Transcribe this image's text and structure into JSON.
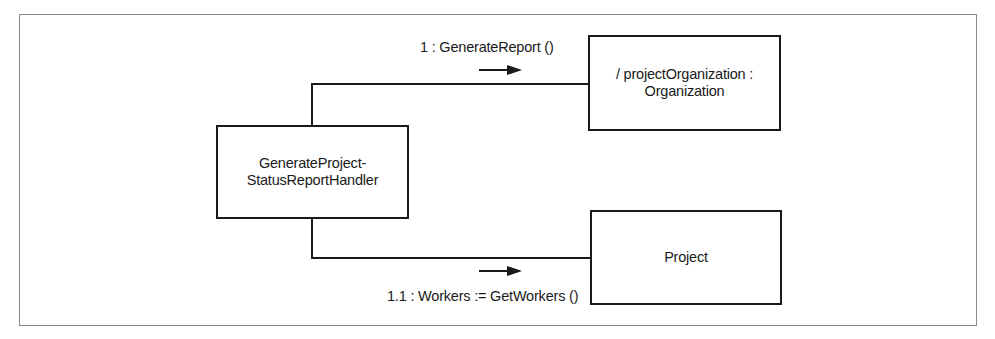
{
  "diagram": {
    "type": "UML communication diagram",
    "objects": [
      {
        "id": "handler",
        "line1": "GenerateProject-",
        "line2": "StatusReportHandler"
      },
      {
        "id": "organization",
        "line1": "/ projectOrganization :",
        "line2": "Organization"
      },
      {
        "id": "project",
        "line1": "Project"
      }
    ],
    "messages": [
      {
        "label": "1 : GenerateReport ()",
        "from": "handler",
        "to": "organization",
        "direction": "right"
      },
      {
        "label": "1.1 : Workers := GetWorkers ()",
        "from": "handler",
        "to": "project",
        "direction": "right"
      }
    ],
    "colors": {
      "line": "#1a1a1a",
      "frame": "#8a8a8a",
      "background": "#ffffff"
    }
  }
}
